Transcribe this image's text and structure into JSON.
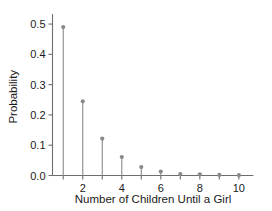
{
  "chart_data": {
    "type": "line",
    "title": "",
    "subtitle": "",
    "xlabel": "Number of Children Until a Girl",
    "ylabel": "Probability",
    "categories": [
      1,
      2,
      3,
      4,
      5,
      6,
      7,
      8,
      9,
      10
    ],
    "values": [
      0.49,
      0.245,
      0.122,
      0.061,
      0.028,
      0.013,
      0.005,
      0.004,
      0.002,
      0.001
    ],
    "series": [
      {
        "name": "Probability",
        "values": [
          0.49,
          0.245,
          0.122,
          0.061,
          0.028,
          0.013,
          0.005,
          0.004,
          0.002,
          0.001
        ]
      }
    ],
    "x": [
      1,
      2,
      3,
      4,
      5,
      6,
      7,
      8,
      9,
      10
    ],
    "xlim": [
      0.45,
      10.75
    ],
    "ylim": [
      0.0,
      0.52
    ],
    "x_ticks": [
      1,
      2,
      3,
      4,
      5,
      6,
      7,
      8,
      9,
      10
    ],
    "x_tick_labels": [
      "",
      "2",
      "",
      "4",
      "",
      "6",
      "",
      "8",
      "",
      "10"
    ],
    "y_ticks": [
      0.0,
      0.1,
      0.2,
      0.3,
      0.4,
      0.5
    ],
    "y_tick_labels": [
      "0.0",
      "0.1",
      "0.2",
      "0.3",
      "0.4",
      "0.5"
    ],
    "grid": false,
    "legend": false,
    "legend_position": "none",
    "marker": "circle",
    "colors": {
      "stem": "#8a8a8a",
      "marker": "#8a8a8a",
      "axis": "#6e6e6e",
      "text": "#1a1a1a",
      "background": "#ffffff"
    }
  }
}
